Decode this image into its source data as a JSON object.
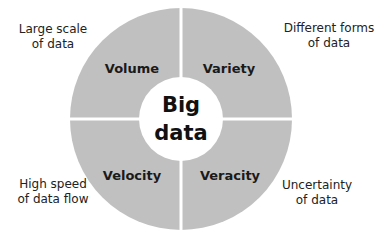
{
  "center": {
    "line1": "Big",
    "line2": "data"
  },
  "quadrants": [
    {
      "label": "Volume",
      "desc1": "Large scale",
      "desc2": "of data"
    },
    {
      "label": "Variety",
      "desc1": "Different forms",
      "desc2": "of data"
    },
    {
      "label": "Velocity",
      "desc1": "High speed",
      "desc2": "of data flow"
    },
    {
      "label": "Veracity",
      "desc1": "Uncertainty",
      "desc2": "of data"
    }
  ],
  "colors": {
    "ring": "#c0c0c0",
    "center": "#ffffff",
    "text": "#1a1a1a"
  }
}
